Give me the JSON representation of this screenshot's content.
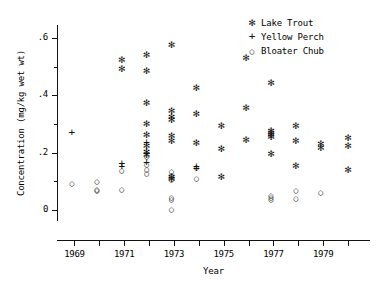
{
  "chart_data": {
    "type": "scatter",
    "title": "",
    "xlabel": "Year",
    "ylabel": "Concentration (mg/kg wet wt)",
    "xlim": [
      1968.3,
      1980.8
    ],
    "ylim": [
      -0.035,
      0.645
    ],
    "grid": false,
    "legend_position": "top-right",
    "x_ticks": [
      1969,
      1970,
      1971,
      1972,
      1973,
      1974,
      1975,
      1976,
      1977,
      1978,
      1979,
      1980
    ],
    "x_tick_labels": [
      "1969",
      "",
      "1971",
      "",
      "1973",
      "",
      "1975",
      "",
      "1977",
      "",
      "1979",
      ""
    ],
    "y_ticks": [
      0,
      0.1,
      0.2,
      0.3,
      0.4,
      0.5,
      0.6
    ],
    "y_tick_labels": [
      "0",
      "",
      ".2",
      "",
      ".4",
      "",
      ".6"
    ],
    "series": [
      {
        "name": "Lake Trout",
        "marker": "star",
        "marker_glyph": "✻",
        "points": [
          [
            1970.9,
            0.525
          ],
          [
            1970.9,
            0.495
          ],
          [
            1971.9,
            0.545
          ],
          [
            1971.9,
            0.487
          ],
          [
            1971.9,
            0.378
          ],
          [
            1971.9,
            0.305
          ],
          [
            1971.9,
            0.265
          ],
          [
            1971.9,
            0.225
          ],
          [
            1971.9,
            0.205
          ],
          [
            1971.9,
            0.195
          ],
          [
            1972.9,
            0.578
          ],
          [
            1972.9,
            0.347
          ],
          [
            1972.9,
            0.328
          ],
          [
            1972.9,
            0.318
          ],
          [
            1972.9,
            0.262
          ],
          [
            1972.9,
            0.245
          ],
          [
            1972.9,
            0.118
          ],
          [
            1972.9,
            0.11
          ],
          [
            1973.9,
            0.428
          ],
          [
            1973.9,
            0.338
          ],
          [
            1973.9,
            0.237
          ],
          [
            1974.9,
            0.297
          ],
          [
            1974.9,
            0.217
          ],
          [
            1974.9,
            0.117
          ],
          [
            1975.9,
            0.532
          ],
          [
            1975.9,
            0.36
          ],
          [
            1975.9,
            0.247
          ],
          [
            1976.9,
            0.447
          ],
          [
            1976.9,
            0.278
          ],
          [
            1976.9,
            0.272
          ],
          [
            1976.9,
            0.265
          ],
          [
            1976.9,
            0.258
          ],
          [
            1976.9,
            0.198
          ],
          [
            1977.9,
            0.298
          ],
          [
            1977.9,
            0.245
          ],
          [
            1977.9,
            0.157
          ],
          [
            1978.9,
            0.235
          ],
          [
            1978.9,
            0.218
          ],
          [
            1980.0,
            0.255
          ],
          [
            1980.0,
            0.228
          ],
          [
            1980.0,
            0.142
          ]
        ]
      },
      {
        "name": "Yellow Perch",
        "marker": "plus",
        "marker_glyph": "+",
        "points": [
          [
            1968.9,
            0.272
          ],
          [
            1970.9,
            0.163
          ],
          [
            1970.9,
            0.155
          ],
          [
            1971.9,
            0.238
          ],
          [
            1971.9,
            0.168
          ],
          [
            1971.9,
            0.197
          ],
          [
            1973.9,
            0.155
          ],
          [
            1973.9,
            0.148
          ]
        ]
      },
      {
        "name": "Bloater Chub",
        "marker": "circle",
        "marker_glyph": "○",
        "points": [
          [
            1968.9,
            0.093
          ],
          [
            1969.9,
            0.1
          ],
          [
            1969.9,
            0.073
          ],
          [
            1969.9,
            0.07
          ],
          [
            1970.9,
            0.138
          ],
          [
            1970.9,
            0.072
          ],
          [
            1971.9,
            0.16
          ],
          [
            1971.9,
            0.143
          ],
          [
            1971.9,
            0.13
          ],
          [
            1971.9,
            0.187
          ],
          [
            1972.9,
            0.137
          ],
          [
            1972.9,
            0.123
          ],
          [
            1972.9,
            0.107
          ],
          [
            1972.9,
            0.045
          ],
          [
            1972.9,
            0.037
          ],
          [
            1972.9,
            0.005
          ],
          [
            1973.9,
            0.15
          ],
          [
            1973.9,
            0.113
          ],
          [
            1976.9,
            0.052
          ],
          [
            1976.9,
            0.045
          ],
          [
            1976.9,
            0.037
          ],
          [
            1977.9,
            0.068
          ],
          [
            1977.9,
            0.042
          ],
          [
            1978.9,
            0.063
          ]
        ]
      }
    ]
  },
  "legend": {
    "entries": [
      {
        "marker": "star",
        "glyph": "✻",
        "label": "Lake Trout"
      },
      {
        "marker": "plus",
        "glyph": "+",
        "label": "Yellow Perch"
      },
      {
        "marker": "circle",
        "glyph": "○",
        "label": "Bloater Chub"
      }
    ]
  },
  "colors": {
    "ink": "#111111",
    "background": "#ffffff"
  }
}
